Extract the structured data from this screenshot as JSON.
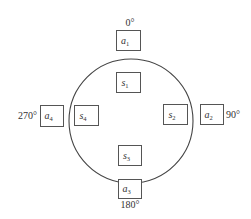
{
  "diagram": {
    "type": "circular-arrangement",
    "circle": {
      "cx": 131,
      "cy": 121,
      "r": 62
    },
    "inner_nodes": [
      {
        "id": "s1",
        "base": "s",
        "sub": "1",
        "x": 116,
        "y": 72,
        "w": 24,
        "h": 20
      },
      {
        "id": "s2",
        "base": "s",
        "sub": "2",
        "x": 163,
        "y": 104,
        "w": 24,
        "h": 20
      },
      {
        "id": "s3",
        "base": "s",
        "sub": "3",
        "x": 118,
        "y": 145,
        "w": 23,
        "h": 20
      },
      {
        "id": "s4",
        "base": "s",
        "sub": "4",
        "x": 74,
        "y": 105,
        "w": 24,
        "h": 20
      }
    ],
    "outer_nodes": [
      {
        "id": "a1",
        "base": "a",
        "sub": "1",
        "x": 116,
        "y": 30,
        "w": 24,
        "h": 20,
        "angle_label": "0°",
        "label_x": 130,
        "label_y": 26,
        "anchor": "middle"
      },
      {
        "id": "a2",
        "base": "a",
        "sub": "2",
        "x": 200,
        "y": 104,
        "w": 23,
        "h": 20,
        "angle_label": "90°",
        "label_x": 226,
        "label_y": 118,
        "anchor": "start"
      },
      {
        "id": "a3",
        "base": "a",
        "sub": "3",
        "x": 118,
        "y": 179,
        "w": 23,
        "h": 19,
        "angle_label": "180°",
        "label_x": 130,
        "label_y": 208,
        "anchor": "middle"
      },
      {
        "id": "a4",
        "base": "a",
        "sub": "4",
        "x": 40,
        "y": 105,
        "w": 23,
        "h": 21,
        "angle_label": "270°",
        "label_x": 37,
        "label_y": 119,
        "anchor": "end"
      }
    ]
  }
}
